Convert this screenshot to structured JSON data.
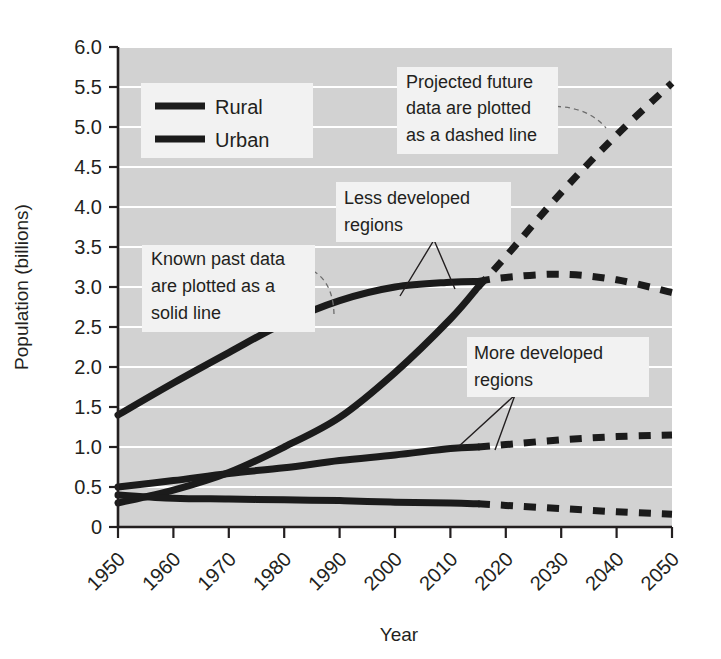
{
  "chart_data": {
    "type": "line",
    "title": "",
    "xlabel": "Year",
    "ylabel": "Population (billions)",
    "xlim": [
      1950,
      2050
    ],
    "ylim": [
      0,
      6.0
    ],
    "grid": true,
    "legend_position": "top-left",
    "x_ticks": [
      "1950",
      "1960",
      "1970",
      "1980",
      "1990",
      "2000",
      "2010",
      "2020",
      "2030",
      "2040",
      "2050"
    ],
    "y_ticks": [
      "0",
      "0.5",
      "1.0",
      "1.5",
      "2.0",
      "2.5",
      "3.0",
      "3.5",
      "4.0",
      "4.5",
      "5.0",
      "5.5",
      "6.0"
    ],
    "legend": [
      {
        "label": "Rural",
        "swatch": "solid-thick-black"
      },
      {
        "label": "Urban",
        "swatch": "solid-thick-black"
      }
    ],
    "split_year": 2015,
    "solid_note": "Known past data are plotted as a solid line",
    "dashed_note": "Projected future data are plotted as a dashed line",
    "x": [
      1950,
      1960,
      1970,
      1980,
      1990,
      2000,
      2010,
      2015,
      2020,
      2030,
      2040,
      2050
    ],
    "series": [
      {
        "name": "Less developed regions — Rural",
        "style": "solid-to-dashed",
        "values": [
          1.4,
          1.8,
          2.18,
          2.55,
          2.83,
          3.0,
          3.06,
          3.07,
          3.12,
          3.16,
          3.09,
          2.93
        ]
      },
      {
        "name": "Less developed regions — Urban",
        "style": "solid-to-dashed",
        "values": [
          0.3,
          0.46,
          0.68,
          1.0,
          1.37,
          1.93,
          2.6,
          3.0,
          3.38,
          4.18,
          4.9,
          5.55
        ]
      },
      {
        "name": "More developed regions — Urban",
        "style": "solid-to-dashed",
        "values": [
          0.5,
          0.58,
          0.67,
          0.74,
          0.83,
          0.9,
          0.98,
          1.0,
          1.03,
          1.09,
          1.13,
          1.15
        ]
      },
      {
        "name": "More developed regions — Rural",
        "style": "solid-to-dashed",
        "values": [
          0.4,
          0.36,
          0.35,
          0.34,
          0.33,
          0.31,
          0.3,
          0.29,
          0.27,
          0.23,
          0.19,
          0.16
        ]
      }
    ],
    "annotations": [
      {
        "id": "known-past-data",
        "lines": [
          "Known past data",
          "are plotted as a",
          "solid line"
        ]
      },
      {
        "id": "projected-future-data",
        "lines": [
          "Projected future",
          "data are plotted",
          "as a dashed line"
        ]
      },
      {
        "id": "less-developed-regions",
        "lines": [
          "Less developed",
          "regions"
        ]
      },
      {
        "id": "more-developed-regions",
        "lines": [
          "More developed",
          "regions"
        ]
      }
    ],
    "colors": {
      "plot_background": "#d2d2d2",
      "gridline": "#ffffff",
      "line": "#1b1b1b",
      "text": "#231f20",
      "annotation_background": "#f2f2f2"
    }
  }
}
